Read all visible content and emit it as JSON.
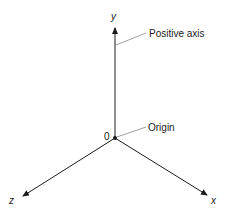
{
  "diagram": {
    "origin": {
      "x": 115,
      "y": 138,
      "label": "0"
    },
    "axes": [
      {
        "name": "y",
        "label": "y",
        "end": {
          "x": 115,
          "y": 27
        }
      },
      {
        "name": "x",
        "label": "x",
        "end": {
          "x": 208,
          "y": 196
        }
      },
      {
        "name": "z",
        "label": "z",
        "end": {
          "x": 22,
          "y": 197
        }
      }
    ],
    "annotations": [
      {
        "text": "Positive axis",
        "target": "y-axis"
      },
      {
        "text": "Origin",
        "target": "origin-point"
      }
    ],
    "colors": {
      "line": "#1a1a1a",
      "leader": "#888888",
      "text": "#222222"
    }
  }
}
